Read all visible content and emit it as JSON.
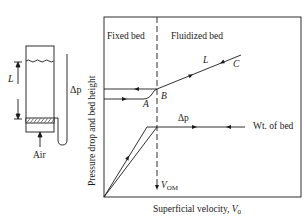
{
  "apparatus": {
    "bed_length_label": "L",
    "pressure_drop_label": "Δp",
    "air_label": "Air"
  },
  "plot": {
    "y_axis_label": "Pressure drop and bed height",
    "x_axis_label_text": "Superficial velocity, ",
    "x_axis_symbol": "V",
    "x_axis_subscript": "0",
    "region_left": "Fixed bed",
    "region_right": "Fluidized bed",
    "point_a": "A",
    "point_b": "B",
    "point_c": "C",
    "bed_height_label": "L",
    "pressure_drop_label": "Δp",
    "weight_label": "Wt. of bed",
    "vom_symbol": "V",
    "vom_subscript": "OM"
  },
  "colors": {
    "line": "#1a1a1a",
    "background": "#ffffff"
  }
}
